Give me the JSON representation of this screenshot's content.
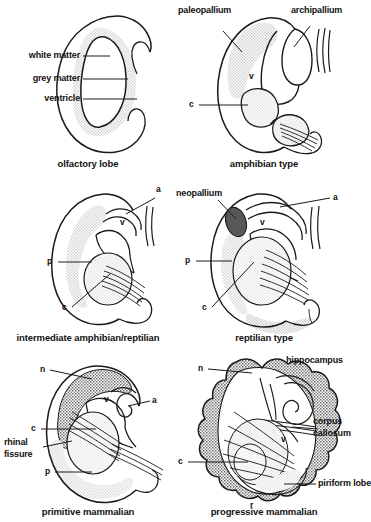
{
  "figure": {
    "colors": {
      "outline": "#1a1a1a",
      "light_grey_fill": "#e2e2e2",
      "mid_grey_fill": "#c9c9c9",
      "dark_grey_fill": "#8a8a8a",
      "very_dark_fill": "#585858",
      "background": "#ffffff",
      "text": "#111111"
    }
  },
  "panels": [
    {
      "id": "olfactory-lobe",
      "caption": "olfactory lobe",
      "labels": [
        {
          "key": "white_matter",
          "text": "white matter"
        },
        {
          "key": "grey_matter",
          "text": "grey matter"
        },
        {
          "key": "ventricle",
          "text": "ventricle"
        }
      ]
    },
    {
      "id": "amphibian-type",
      "caption": "amphibian type",
      "labels": [
        {
          "key": "paleopallium",
          "text": "paleopallium"
        },
        {
          "key": "archipallium",
          "text": "archipallium"
        },
        {
          "key": "v",
          "text": "v"
        },
        {
          "key": "c",
          "text": "c"
        }
      ]
    },
    {
      "id": "intermediate-amphibian-reptilian",
      "caption": "intermediate amphibian/reptilian",
      "labels": [
        {
          "key": "a",
          "text": "a"
        },
        {
          "key": "v",
          "text": "v"
        },
        {
          "key": "p",
          "text": "p"
        },
        {
          "key": "c",
          "text": "c"
        }
      ]
    },
    {
      "id": "reptilian-type",
      "caption": "reptilian type",
      "labels": [
        {
          "key": "neopallium",
          "text": "neopallium"
        },
        {
          "key": "a",
          "text": "a"
        },
        {
          "key": "v",
          "text": "v"
        },
        {
          "key": "p",
          "text": "p"
        },
        {
          "key": "c",
          "text": "c"
        }
      ]
    },
    {
      "id": "primitive-mammalian",
      "caption": "primitive mammalian",
      "labels": [
        {
          "key": "n",
          "text": "n"
        },
        {
          "key": "a",
          "text": "a"
        },
        {
          "key": "v",
          "text": "v"
        },
        {
          "key": "c",
          "text": "c"
        },
        {
          "key": "rhinal_fissure_line1",
          "text": "rhinal"
        },
        {
          "key": "rhinal_fissure_line2",
          "text": "fissure"
        },
        {
          "key": "p",
          "text": "p"
        }
      ]
    },
    {
      "id": "progressive-mammalian",
      "caption": "progressive mammalian",
      "labels": [
        {
          "key": "n",
          "text": "n"
        },
        {
          "key": "hippocampus",
          "text": "hippocampus"
        },
        {
          "key": "corpus_line1",
          "text": "corpus"
        },
        {
          "key": "corpus_line2",
          "text": "callosum"
        },
        {
          "key": "v",
          "text": "v"
        },
        {
          "key": "c",
          "text": "c"
        },
        {
          "key": "piriform_lobe",
          "text": "piriform lobe"
        },
        {
          "key": "r",
          "text": "r"
        }
      ]
    }
  ]
}
